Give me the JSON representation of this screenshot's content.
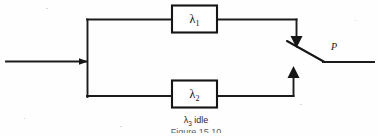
{
  "figure": {
    "type": "reliability-block-diagram",
    "caption_bottom": "λ3 idle",
    "caption_bottom_main": "λ",
    "caption_bottom_sub": "3",
    "caption_bottom_tail": " idle",
    "figure_number_partial": "Figure 15.10",
    "background_color": "#fefefe",
    "ink_color": "#1c1c1c"
  },
  "blocks": [
    {
      "id": "lambda1",
      "label_main": "λ",
      "label_sub": "1",
      "label_full": "λ1",
      "branch": "top"
    },
    {
      "id": "lambda2",
      "label_main": "λ",
      "label_sub": "2",
      "label_full": "λ2",
      "branch": "bottom"
    }
  ],
  "switch": {
    "id": "switch-p",
    "label": "P",
    "state": "open-blade"
  },
  "wires": {
    "input_label": "input-line",
    "bus_label": "vertical-split-bus",
    "output_label": "output-line",
    "top_branch_label": "top-branch-wire",
    "bottom_branch_label": "bottom-branch-wire"
  },
  "arrows": [
    {
      "id": "input-arrow",
      "direction": "right"
    },
    {
      "id": "top-feed-arrow",
      "direction": "down"
    },
    {
      "id": "bottom-feed-arrow",
      "direction": "up"
    }
  ]
}
